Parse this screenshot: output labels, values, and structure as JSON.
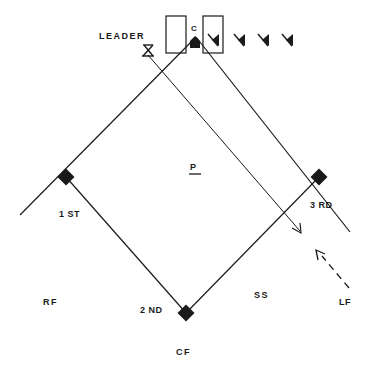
{
  "diagram": {
    "type": "baseball-field-drill",
    "colors": {
      "ink": "#1a1a1a",
      "background": "#ffffff"
    },
    "labels": {
      "leader": "LEADER",
      "catcher": "C",
      "pitcher": "P",
      "first_base": "1 ST",
      "second_base": "2 ND",
      "third_base": "3 RD",
      "shortstop": "SS",
      "left_field": "LF",
      "center_field": "CF",
      "right_field": "RF"
    },
    "players_in_line_count": 4,
    "markers": [
      "batter-box-left",
      "batter-box-right",
      "home-plate",
      "leader-marker",
      "queued-player-1",
      "queued-player-2",
      "queued-player-3",
      "queued-player-4",
      "throw-arrow",
      "runner-dashed-arrow"
    ]
  }
}
